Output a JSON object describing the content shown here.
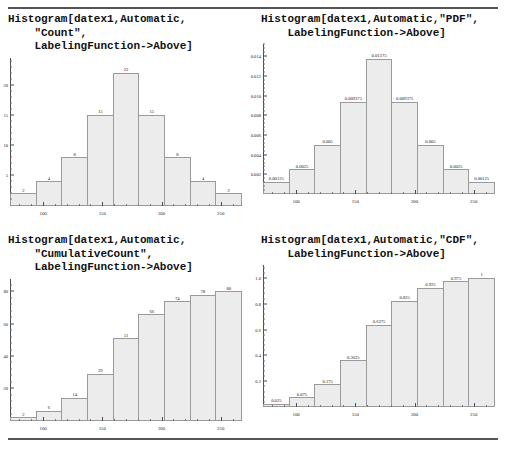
{
  "page": {
    "background": "#ffffff",
    "bar_fill": "#ececec",
    "bar_stroke": "#9a9a9a",
    "axis_color": "#4d4d4d",
    "rule_color": "#555555"
  },
  "cells": [
    {
      "id": "count",
      "code": "Histogram[datex1,Automatic,\n    \"Count\",\n    LabelingFunction->Above]",
      "chart_data": {
        "type": "bar",
        "title": "Histogram[datex1,Automatic,\"Count\",LabelingFunction->Above]",
        "xlabel": "",
        "ylabel": "",
        "categories": [
          "80-100",
          "100-120",
          "120-140",
          "140-160",
          "160-180",
          "180-200",
          "200-220",
          "220-240",
          "240-260"
        ],
        "bin_edges": [
          80,
          100,
          120,
          140,
          160,
          180,
          200,
          220,
          240,
          260
        ],
        "values": [
          2,
          4,
          8,
          15,
          22,
          15,
          8,
          4,
          2
        ],
        "labels": [
          "2",
          "4",
          "8",
          "15",
          "22",
          "15",
          "8",
          "4",
          "2"
        ],
        "ylim": [
          0,
          24.5
        ],
        "yticks": [
          5,
          10,
          15,
          20
        ],
        "yticklabels": [
          "5",
          "10",
          "15",
          "20"
        ],
        "xlim": [
          72,
          268
        ],
        "xticks": [
          100,
          150,
          200,
          250
        ],
        "xticklabels": [
          "100",
          "150",
          "200",
          "250"
        ],
        "grid": false,
        "legend": "none"
      }
    },
    {
      "id": "pdf",
      "code": "Histogram[datex1,Automatic,\"PDF\",\n    LabelingFunction->Above]",
      "chart_data": {
        "type": "bar",
        "title": "Histogram[datex1,Automatic,\"PDF\",LabelingFunction->Above]",
        "xlabel": "",
        "ylabel": "",
        "categories": [
          "80-100",
          "100-120",
          "120-140",
          "140-160",
          "160-180",
          "180-200",
          "200-220",
          "220-240",
          "240-260"
        ],
        "bin_edges": [
          80,
          100,
          120,
          140,
          160,
          180,
          200,
          220,
          240,
          260
        ],
        "values": [
          0.00125,
          0.0025,
          0.005,
          0.009375,
          0.01375,
          0.009375,
          0.005,
          0.0025,
          0.00125
        ],
        "labels": [
          "0.00125",
          "0.0025",
          "0.005",
          "0.009375",
          "0.01375",
          "0.009375",
          "0.005",
          "0.0025",
          "0.00125"
        ],
        "ylim": [
          0,
          0.01525
        ],
        "yticks": [
          0.002,
          0.004,
          0.006,
          0.008,
          0.01,
          0.012,
          0.014
        ],
        "yticklabels": [
          "0.002",
          "0.004",
          "0.006",
          "0.008",
          "0.010",
          "0.012",
          "0.014"
        ],
        "xlim": [
          72,
          268
        ],
        "xticks": [
          100,
          150,
          200,
          250
        ],
        "xticklabels": [
          "100",
          "150",
          "200",
          "250"
        ],
        "grid": false,
        "legend": "none"
      }
    },
    {
      "id": "cumcount",
      "code": "Histogram[datex1,Automatic,\n    \"CumulativeCount\",\n    LabelingFunction->Above]",
      "chart_data": {
        "type": "bar",
        "title": "Histogram[datex1,Automatic,\"CumulativeCount\",LabelingFunction->Above]",
        "xlabel": "",
        "ylabel": "",
        "categories": [
          "80-100",
          "100-120",
          "120-140",
          "140-160",
          "160-180",
          "180-200",
          "200-220",
          "220-240",
          "240-260"
        ],
        "bin_edges": [
          80,
          100,
          120,
          140,
          160,
          180,
          200,
          220,
          240,
          260
        ],
        "values": [
          2,
          6,
          14,
          29,
          51,
          66,
          74,
          78,
          80
        ],
        "labels": [
          "2",
          "6",
          "14",
          "29",
          "51",
          "66",
          "74",
          "78",
          "80"
        ],
        "ylim": [
          0,
          88
        ],
        "yticks": [
          20,
          40,
          60,
          80
        ],
        "yticklabels": [
          "20",
          "40",
          "60",
          "80"
        ],
        "xlim": [
          72,
          268
        ],
        "xticks": [
          100,
          150,
          200,
          250
        ],
        "xticklabels": [
          "100",
          "150",
          "200",
          "250"
        ],
        "grid": false,
        "legend": "none"
      }
    },
    {
      "id": "cdf",
      "code": "Histogram[datex1,Automatic,\"CDF\",\n    LabelingFunction->Above]",
      "chart_data": {
        "type": "bar",
        "title": "Histogram[datex1,Automatic,\"CDF\",LabelingFunction->Above]",
        "xlabel": "",
        "ylabel": "",
        "categories": [
          "80-100",
          "100-120",
          "120-140",
          "140-160",
          "160-180",
          "180-200",
          "200-220",
          "220-240",
          "240-260"
        ],
        "bin_edges": [
          80,
          100,
          120,
          140,
          160,
          180,
          200,
          220,
          240,
          260
        ],
        "values": [
          0.025,
          0.075,
          0.175,
          0.3625,
          0.6375,
          0.825,
          0.925,
          0.975,
          1
        ],
        "labels": [
          "0.025",
          "0.075",
          "0.175",
          "0.3625",
          "0.6375",
          "0.825",
          "0.925",
          "0.975",
          "1"
        ],
        "ylim": [
          0,
          1.1
        ],
        "yticks": [
          0.2,
          0.4,
          0.6,
          0.8,
          1.0
        ],
        "yticklabels": [
          "0.2",
          "0.4",
          "0.6",
          "0.8",
          "1.0"
        ],
        "xlim": [
          72,
          268
        ],
        "xticks": [
          100,
          150,
          200,
          250
        ],
        "xticklabels": [
          "100",
          "150",
          "200",
          "250"
        ],
        "grid": false,
        "legend": "none"
      }
    }
  ]
}
